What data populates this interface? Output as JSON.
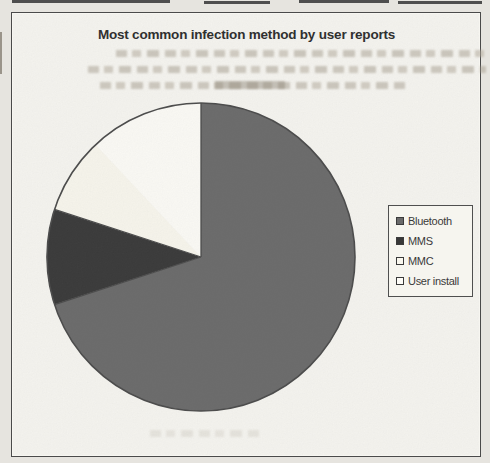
{
  "chart_data": {
    "type": "pie",
    "title": "Most common infection method by user reports",
    "categories": [
      "Bluetooth",
      "MMS",
      "MMC",
      "User install"
    ],
    "values": [
      70,
      10,
      8,
      12
    ],
    "values_note": "percent, estimated from slice angles; no data labels printed on chart",
    "start_angle_deg": 0,
    "direction": "clockwise",
    "colors": [
      "#6a6a6a",
      "#383838",
      "#f9f7ee",
      "#fdfcf7"
    ],
    "outline_color": "#4a4a4a",
    "hidden_boundary_indices": [
      3
    ],
    "legend_position": "right",
    "grid": false
  },
  "legend": {
    "items": [
      {
        "label": "Bluetooth"
      },
      {
        "label": "MMS"
      },
      {
        "label": "MMC"
      },
      {
        "label": "User install"
      }
    ]
  }
}
